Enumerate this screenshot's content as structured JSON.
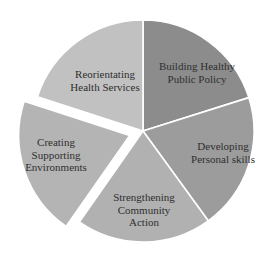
{
  "chart_data": {
    "type": "pie",
    "title": "",
    "exploded": [
      "Creating Supporting Environments"
    ],
    "center": [
      143,
      131
    ],
    "radius": 111,
    "categories": [
      "Building Healthy Public Policy",
      "Developing Personal skills",
      "Strengthening Community Action",
      "Creating Supporting Environments",
      "Reorientating Health Services"
    ],
    "values": [
      20,
      20,
      20,
      20,
      20
    ],
    "slices": [
      {
        "label_lines": [
          "Building Healthy",
          "Public Policy"
        ],
        "start": -90,
        "end": -17.5,
        "color": "#8c8c8c",
        "label_pos": [
          197,
          72
        ]
      },
      {
        "label_lines": [
          "Developing",
          "Personal skills"
        ],
        "start": -17.5,
        "end": 54,
        "color": "#9c9c9c",
        "label_pos": [
          223,
          152
        ]
      },
      {
        "label_lines": [
          "Strengthening",
          "Community",
          "Action"
        ],
        "start": 54,
        "end": 125,
        "color": "#b1b1b1",
        "label_pos": [
          144,
          210
        ]
      },
      {
        "label_lines": [
          "Creating",
          "Supporting",
          "Environments"
        ],
        "start": 125,
        "end": 198,
        "color": "#b4b4b4",
        "label_pos": [
          56,
          155
        ],
        "explode": 14
      },
      {
        "label_lines": [
          "Reorientating",
          "Health Services"
        ],
        "start": 198,
        "end": 270,
        "color": "#c1c1c1",
        "label_pos": [
          105,
          80
        ]
      }
    ]
  }
}
